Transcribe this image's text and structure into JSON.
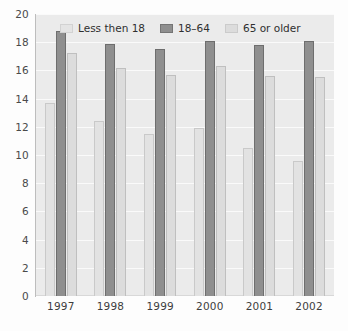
{
  "chart_data": {
    "type": "bar",
    "title": "",
    "subtitle": "",
    "xlabel": "",
    "ylabel": "",
    "categories": [
      "1997",
      "1998",
      "1999",
      "2000",
      "2001",
      "2002"
    ],
    "series": [
      {
        "name": "Less then 18",
        "color": "#e2e2e2",
        "values": [
          13.7,
          12.4,
          11.5,
          11.9,
          10.5,
          9.6
        ]
      },
      {
        "name": "18–64",
        "color": "#8f8f8f",
        "values": [
          18.8,
          17.9,
          17.5,
          18.1,
          17.8,
          18.1
        ]
      },
      {
        "name": "65 or older",
        "color": "#dcdcdc",
        "values": [
          17.2,
          16.2,
          15.7,
          16.3,
          15.6,
          15.5
        ]
      }
    ],
    "ylim": [
      0,
      20
    ],
    "ytick_step": 2,
    "yticks": [
      "20",
      "18",
      "16",
      "14",
      "12",
      "10",
      "8",
      "6",
      "4",
      "2",
      "0"
    ],
    "grid": true,
    "grid_color": "#fafafa",
    "legend_position": "top-inside",
    "plot_background": "#ebebeb",
    "annotations": []
  }
}
